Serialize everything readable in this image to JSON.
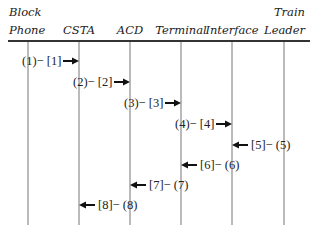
{
  "diagram": {
    "participants": [
      {
        "id": "block_phone",
        "line1": "Block",
        "line2": "Phone",
        "x": 28
      },
      {
        "id": "csta",
        "line1": "",
        "line2": "CSTA",
        "x": 79
      },
      {
        "id": "acd",
        "line1": "",
        "line2": "ACD",
        "x": 130
      },
      {
        "id": "terminal",
        "line1": "",
        "line2": "Terminal",
        "x": 181
      },
      {
        "id": "interface",
        "line1": "",
        "line2": "Interface",
        "x": 232
      },
      {
        "id": "train_leader",
        "line1": "Train",
        "line2": "Leader",
        "x": 284
      }
    ],
    "messages": [
      {
        "label": "(1)− [1]",
        "from": "block_phone",
        "to": "csta",
        "direction": "right",
        "y": 61
      },
      {
        "label": "(2)− [2]",
        "from": "csta",
        "to": "acd",
        "direction": "right",
        "y": 82
      },
      {
        "label": "(3)− [3]",
        "from": "acd",
        "to": "terminal",
        "direction": "right",
        "y": 103
      },
      {
        "label": "(4)− [4]",
        "from": "terminal",
        "to": "interface",
        "direction": "right",
        "y": 124
      },
      {
        "label": "[5]− (5)",
        "from": "train_leader",
        "to": "interface",
        "direction": "left",
        "y": 145
      },
      {
        "label": "[6]− (6)",
        "from": "interface",
        "to": "terminal",
        "direction": "left",
        "y": 165
      },
      {
        "label": "[7]− (7)",
        "from": "terminal",
        "to": "acd",
        "direction": "left",
        "y": 185
      },
      {
        "label": "[8]− (8)",
        "from": "acd",
        "to": "csta",
        "direction": "left",
        "y": 205
      }
    ]
  }
}
